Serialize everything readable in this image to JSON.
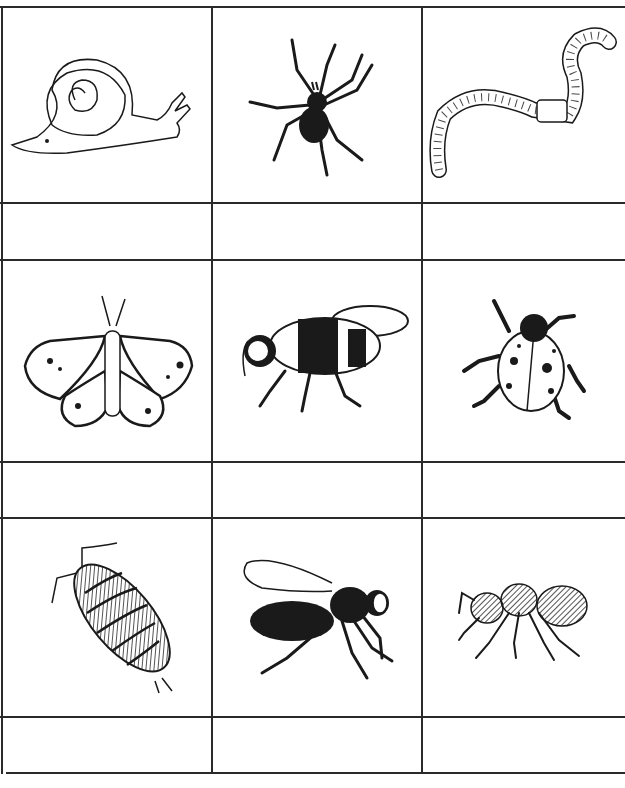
{
  "worksheet": {
    "rows": [
      {
        "animals": [
          {
            "name": "snail",
            "label": ""
          },
          {
            "name": "spider",
            "label": ""
          },
          {
            "name": "earthworm",
            "label": ""
          }
        ]
      },
      {
        "animals": [
          {
            "name": "butterfly",
            "label": ""
          },
          {
            "name": "bumblebee",
            "label": ""
          },
          {
            "name": "ladybird",
            "label": ""
          }
        ]
      },
      {
        "animals": [
          {
            "name": "woodlouse",
            "label": ""
          },
          {
            "name": "wasp",
            "label": ""
          },
          {
            "name": "ant",
            "label": ""
          }
        ]
      }
    ],
    "colors": {
      "ink": "#1a1a1a",
      "paper": "#ffffff",
      "grid": "#2a2a2a"
    }
  }
}
